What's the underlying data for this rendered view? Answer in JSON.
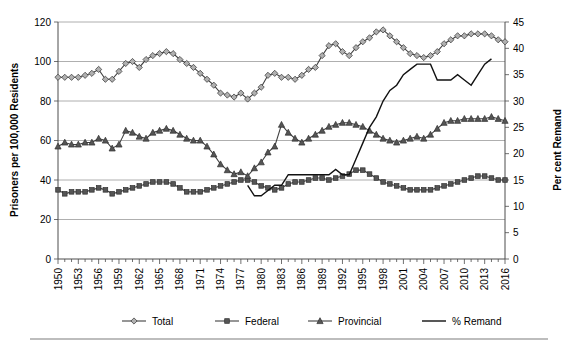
{
  "chart_data": {
    "type": "line",
    "title": "",
    "xlabel": "",
    "ylabel": "Prisoners per 100,000 Residents",
    "y2label": "Per cent Remand",
    "xlim": [
      1950,
      2016
    ],
    "ylim": [
      0,
      120
    ],
    "y2lim": [
      0,
      45
    ],
    "yticks": [
      0,
      20,
      40,
      60,
      80,
      100,
      120
    ],
    "y2ticks": [
      0,
      5,
      10,
      15,
      20,
      25,
      30,
      35,
      40,
      45
    ],
    "xticks": [
      1950,
      1953,
      1956,
      1959,
      1962,
      1965,
      1968,
      1971,
      1974,
      1977,
      1980,
      1983,
      1986,
      1989,
      1992,
      1995,
      1998,
      2001,
      2004,
      2007,
      2010,
      2013,
      2016
    ],
    "grid": true,
    "legend_position": "bottom",
    "x": [
      1950,
      1951,
      1952,
      1953,
      1954,
      1955,
      1956,
      1957,
      1958,
      1959,
      1960,
      1961,
      1962,
      1963,
      1964,
      1965,
      1966,
      1967,
      1968,
      1969,
      1970,
      1971,
      1972,
      1973,
      1974,
      1975,
      1976,
      1977,
      1978,
      1979,
      1980,
      1981,
      1982,
      1983,
      1984,
      1985,
      1986,
      1987,
      1988,
      1989,
      1990,
      1991,
      1992,
      1993,
      1994,
      1995,
      1996,
      1997,
      1998,
      1999,
      2000,
      2001,
      2002,
      2003,
      2004,
      2005,
      2006,
      2007,
      2008,
      2009,
      2010,
      2011,
      2012,
      2013,
      2014,
      2015,
      2016
    ],
    "series": [
      {
        "name": "Total",
        "marker": "diamond",
        "axis": "left",
        "values": [
          92,
          92,
          92,
          92,
          93,
          94,
          96,
          91,
          91,
          95,
          99,
          100,
          97,
          101,
          103,
          104,
          105,
          104,
          101,
          99,
          97,
          94,
          91,
          88,
          84,
          83,
          82,
          84,
          81,
          84,
          87,
          93,
          94,
          92,
          92,
          91,
          93,
          96,
          97,
          103,
          108,
          109,
          105,
          103,
          107,
          110,
          112,
          115,
          116,
          113,
          110,
          107,
          104,
          103,
          102,
          103,
          105,
          109,
          111,
          113,
          113,
          114,
          114,
          114,
          113,
          111,
          110
        ]
      },
      {
        "name": "Federal",
        "marker": "square",
        "axis": "left",
        "values": [
          35,
          33,
          34,
          34,
          34,
          35,
          36,
          35,
          33,
          34,
          35,
          36,
          37,
          38,
          39,
          39,
          39,
          38,
          36,
          34,
          34,
          34,
          35,
          36,
          37,
          38,
          39,
          40,
          40,
          39,
          37,
          36,
          35,
          36,
          38,
          39,
          39,
          40,
          41,
          41,
          40,
          41,
          42,
          43,
          45,
          45,
          43,
          41,
          39,
          38,
          37,
          36,
          35,
          35,
          35,
          35,
          36,
          37,
          38,
          39,
          40,
          41,
          42,
          42,
          41,
          40,
          40
        ]
      },
      {
        "name": "Provincial",
        "marker": "triangle",
        "axis": "left",
        "values": [
          57,
          59,
          58,
          58,
          59,
          59,
          61,
          60,
          56,
          58,
          65,
          64,
          62,
          61,
          64,
          65,
          66,
          65,
          63,
          61,
          60,
          60,
          57,
          53,
          48,
          45,
          43,
          44,
          42,
          46,
          49,
          54,
          57,
          68,
          64,
          61,
          59,
          61,
          63,
          65,
          67,
          68,
          69,
          69,
          68,
          67,
          65,
          63,
          61,
          60,
          59,
          60,
          61,
          62,
          61,
          63,
          66,
          69,
          70,
          70,
          71,
          71,
          71,
          71,
          72,
          71,
          70
        ]
      },
      {
        "name": "% Remand",
        "marker": "none",
        "axis": "right",
        "x_start": 1978,
        "values_from_1978": [
          14,
          12,
          12,
          13,
          14,
          14,
          16,
          16,
          16,
          16,
          16,
          16,
          16,
          17,
          16,
          16,
          19,
          22,
          25,
          27,
          30,
          32,
          33,
          35,
          36,
          37,
          37,
          37,
          34,
          34,
          34,
          35,
          34,
          33,
          35,
          37,
          38
        ]
      }
    ],
    "legend": [
      {
        "label": "Total",
        "marker": "diamond-marker"
      },
      {
        "label": "Federal",
        "marker": "square-marker"
      },
      {
        "label": "Provincial",
        "marker": "triangle-marker"
      },
      {
        "label": "% Remand",
        "marker": "plain-line"
      }
    ],
    "colors": {
      "total": "#b0b0b0",
      "federal": "#555555",
      "provincial": "#555555",
      "remand": "#111111",
      "grid": "#9a9a9a",
      "axis": "#4d4d4d",
      "background": "#ffffff"
    }
  }
}
